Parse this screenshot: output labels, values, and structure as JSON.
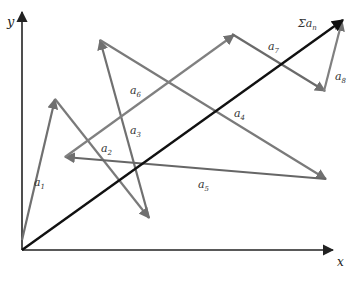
{
  "figure": {
    "axes": {
      "x_label": "x",
      "y_label": "y",
      "origin": [
        22,
        250
      ],
      "x_end": [
        333,
        250
      ],
      "y_end": [
        22,
        12
      ],
      "color": "#222222"
    },
    "vectors": [
      {
        "id": "a1",
        "label": "a",
        "sub": "1",
        "from": [
          22,
          240
        ],
        "to": [
          55,
          99
        ],
        "label_pos": [
          34,
          186
        ],
        "color": "#707070"
      },
      {
        "id": "a2",
        "label": "a",
        "sub": "2",
        "from": [
          55,
          99
        ],
        "to": [
          149,
          218
        ],
        "label_pos": [
          101,
          152
        ],
        "color": "#7a7a7a"
      },
      {
        "id": "a3",
        "label": "a",
        "sub": "3",
        "from": [
          149,
          218
        ],
        "to": [
          100,
          40
        ],
        "label_pos": [
          130,
          134
        ],
        "color": "#707070"
      },
      {
        "id": "a4",
        "label": "a",
        "sub": "4",
        "from": [
          100,
          40
        ],
        "to": [
          326,
          179
        ],
        "label_pos": [
          234,
          117
        ],
        "color": "#7a7a7a"
      },
      {
        "id": "a5",
        "label": "a",
        "sub": "5",
        "from": [
          326,
          179
        ],
        "to": [
          65,
          157
        ],
        "label_pos": [
          198,
          188
        ],
        "color": "#666666"
      },
      {
        "id": "a6",
        "label": "a",
        "sub": "6",
        "from": [
          65,
          157
        ],
        "to": [
          234,
          35
        ],
        "label_pos": [
          130,
          94
        ],
        "color": "#808080"
      },
      {
        "id": "a7",
        "label": "a",
        "sub": "7",
        "from": [
          232,
          34
        ],
        "to": [
          325,
          91
        ],
        "label_pos": [
          268,
          50
        ],
        "color": "#6a6a6a"
      },
      {
        "id": "a8",
        "label": "a",
        "sub": "8",
        "from": [
          324,
          91
        ],
        "to": [
          342,
          21
        ],
        "label_pos": [
          335,
          80
        ],
        "color": "#808080"
      }
    ],
    "resultant": {
      "label_prefix": "Σ",
      "label": "a",
      "sub": "n",
      "from": [
        22,
        250
      ],
      "to": [
        343,
        20
      ],
      "label_pos": [
        298,
        27
      ],
      "color": "#111111"
    }
  }
}
